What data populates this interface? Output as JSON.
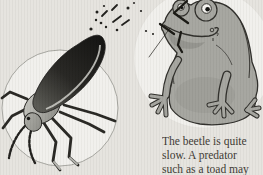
{
  "caption": {
    "lines": [
      "The beetle is quite",
      "slow. A predator",
      "such as a toad may"
    ]
  },
  "figures": {
    "left_vignette": "bombardier-beetle-illustration",
    "right_vignette": "toad-illustration",
    "effect": "defensive-spray-droplets"
  },
  "colors": {
    "background": "#e5e3de",
    "vignette": "#f1f0ec",
    "vignette_outline": "#92928c",
    "ink": "#1c1b18",
    "beetle_shell_dark": "#0f0f0d",
    "beetle_shell_mid": "#55554f",
    "beetle_body_light": "#c9c9c3",
    "beetle_body_dark": "#82827c",
    "toad_body": "#a4a49e",
    "toad_shade": "#80807a",
    "toad_outline": "#2b2a26",
    "eye_white": "#f6f5f1",
    "pupil": "#0e0e0c",
    "text": "#3a362f"
  }
}
